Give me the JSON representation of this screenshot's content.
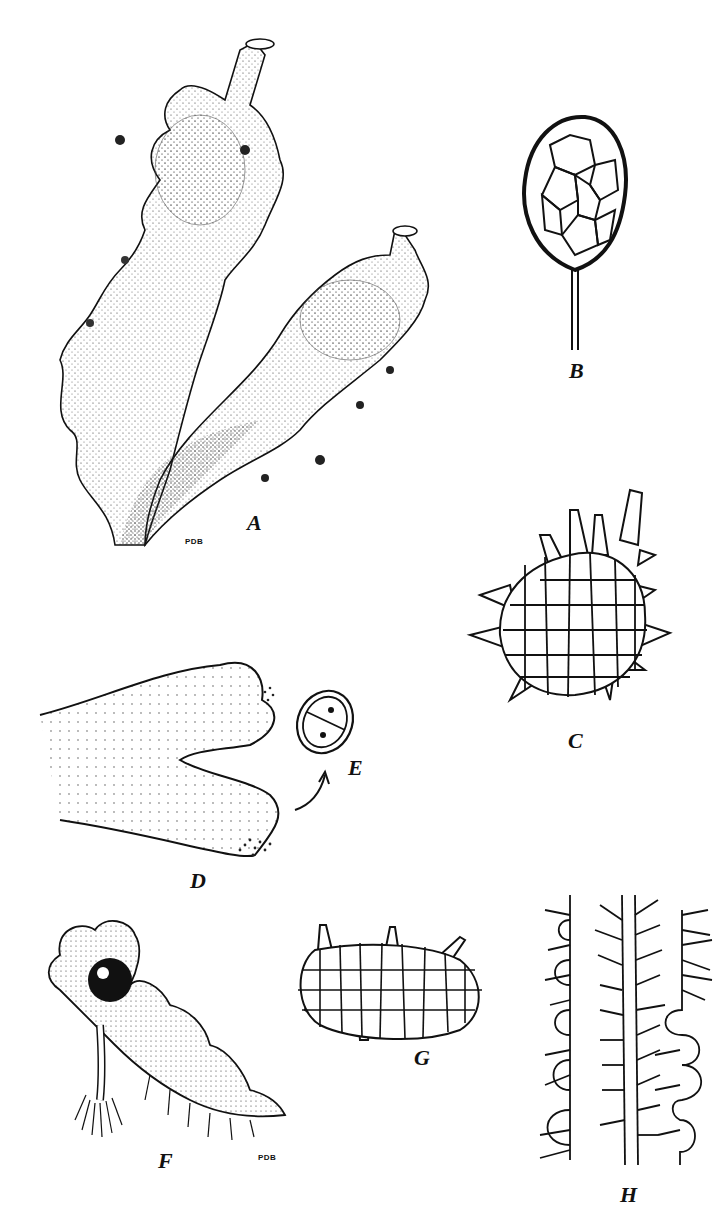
{
  "figure": {
    "background": "#ffffff",
    "ink": "#111111",
    "panels": [
      {
        "id": "A",
        "label": "A",
        "subject": "branched thallus with two raised stalked structures",
        "signature": "PDB"
      },
      {
        "id": "B",
        "label": "B",
        "subject": "stalked ovoid capsule with reticulate wall cells"
      },
      {
        "id": "C",
        "label": "C",
        "subject": "spiny multicellular body (cell network)"
      },
      {
        "id": "D",
        "label": "D",
        "subject": "notched thallus tip with stippled margins"
      },
      {
        "id": "E",
        "label": "E",
        "subject": "two-celled spore with nuclei"
      },
      {
        "id": "F",
        "label": "F",
        "subject": "thallus with dark globose body and rhizoids",
        "signature": "PDB"
      },
      {
        "id": "G",
        "label": "G",
        "subject": "oval cell network with few spines"
      },
      {
        "id": "H",
        "label": "H",
        "subject": "three filament strands with branched hairs"
      }
    ]
  }
}
